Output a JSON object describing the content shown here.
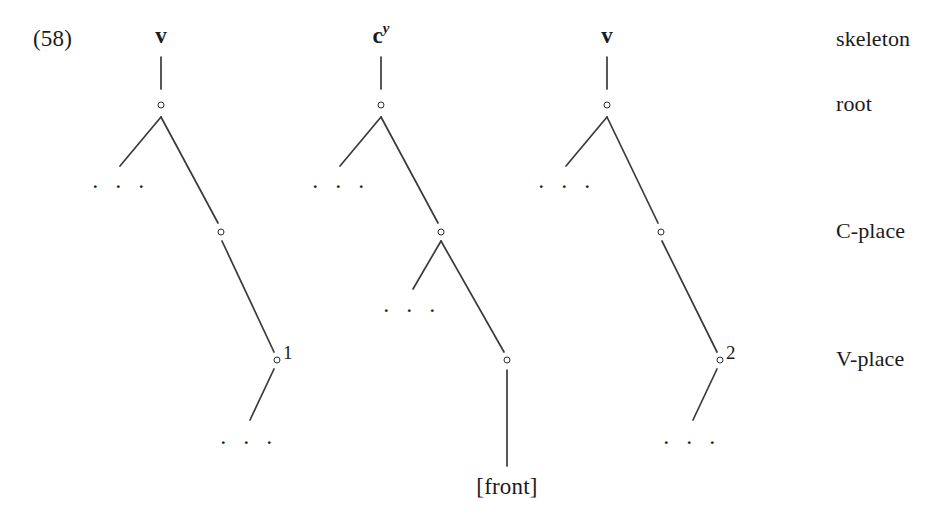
{
  "figure": {
    "example_number": "(58)",
    "background_color": "#ffffff",
    "line_color": "#3a3a3a",
    "text_color": "#1b1b1b"
  },
  "tier_labels": [
    {
      "name": "skeleton",
      "label": "skeleton",
      "y": 40
    },
    {
      "name": "root",
      "label": "root",
      "y": 105
    },
    {
      "name": "c-place",
      "label": "C-place",
      "y": 232
    },
    {
      "name": "v-place",
      "label": "V-place",
      "y": 360
    }
  ],
  "trees": [
    {
      "id": "tree-1",
      "skeleton_label": "v",
      "skeleton_superscript": "",
      "root_node": {
        "x": 161,
        "y": 105
      },
      "c_place_node": {
        "x": 221,
        "y": 232
      },
      "v_place_node": {
        "x": 277,
        "y": 360
      },
      "v_place_superscript": "1",
      "root_ellipsis": ". . .",
      "c_place_ellipsis": "",
      "bottom_ellipsis": ". . .",
      "terminal_feature": ""
    },
    {
      "id": "tree-2",
      "skeleton_label": "c",
      "skeleton_superscript": "y",
      "root_node": {
        "x": 381,
        "y": 105
      },
      "c_place_node": {
        "x": 441,
        "y": 232
      },
      "v_place_node": {
        "x": 507,
        "y": 360
      },
      "v_place_superscript": "",
      "root_ellipsis": ". . .",
      "c_place_ellipsis": ". . .",
      "bottom_ellipsis": "",
      "terminal_feature": "[front]"
    },
    {
      "id": "tree-3",
      "skeleton_label": "v",
      "skeleton_superscript": "",
      "root_node": {
        "x": 607,
        "y": 105
      },
      "c_place_node": {
        "x": 661,
        "y": 232
      },
      "v_place_node": {
        "x": 720,
        "y": 360
      },
      "v_place_superscript": "2",
      "root_ellipsis": ". . .",
      "c_place_ellipsis": "",
      "bottom_ellipsis": ". . .",
      "terminal_feature": ""
    }
  ]
}
